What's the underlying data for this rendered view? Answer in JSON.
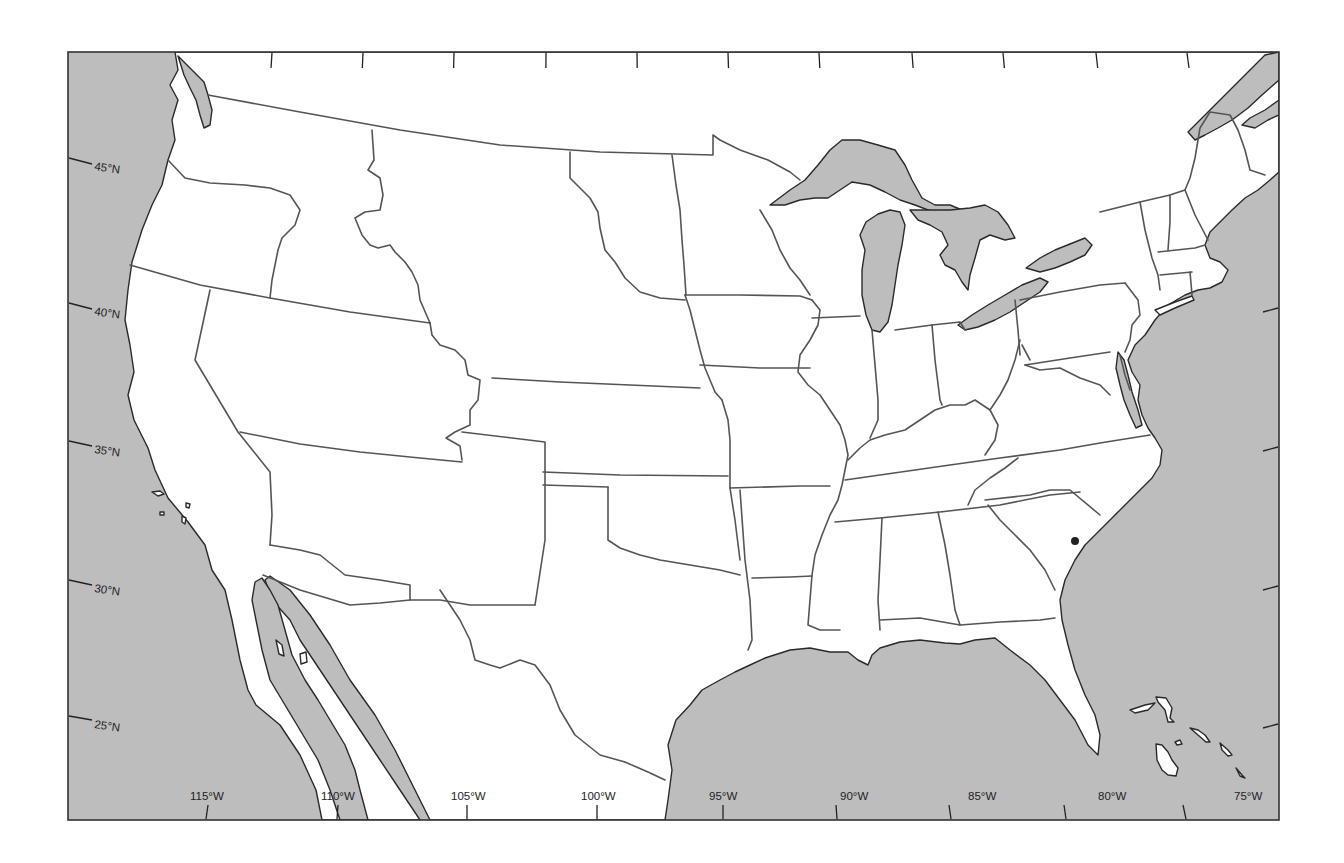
{
  "map": {
    "title": "United States About 1860",
    "colors": {
      "water": "#bdbdbd",
      "land": "#ffffff",
      "border": "#555555",
      "coastline": "#2a2a2a"
    },
    "frame": {
      "left": 68,
      "top": 52,
      "right": 1279,
      "bottom": 820
    },
    "latitude_labels": [
      {
        "label": "45°N",
        "y": 164
      },
      {
        "label": "40°N",
        "y": 310
      },
      {
        "label": "35°N",
        "y": 450
      },
      {
        "label": "30°N",
        "y": 590
      },
      {
        "label": "25°N",
        "y": 725
      }
    ],
    "longitude_labels": [
      {
        "label": "115°W",
        "x": 207
      },
      {
        "label": "110°W",
        "x": 338
      },
      {
        "label": "105°W",
        "x": 469
      },
      {
        "label": "100°W",
        "x": 598
      },
      {
        "label": "95°W",
        "x": 728
      },
      {
        "label": "90°W",
        "x": 857
      },
      {
        "label": "85°W",
        "x": 986
      },
      {
        "label": "80°W",
        "x": 1116
      },
      {
        "label": "75°W",
        "x": 1250
      }
    ],
    "top_tick_x": [
      240,
      292,
      344,
      396,
      446,
      496,
      546,
      598,
      648,
      700,
      752,
      804,
      856,
      908,
      960,
      1012,
      1064,
      1115
    ],
    "right_tick_y": [
      308,
      447,
      586,
      724
    ],
    "features": [
      {
        "name": "Pacific Ocean",
        "type": "water"
      },
      {
        "name": "Gulf of Mexico",
        "type": "water"
      },
      {
        "name": "Atlantic Ocean",
        "type": "water"
      },
      {
        "name": "Gulf of California",
        "type": "water"
      },
      {
        "name": "Lake Superior",
        "type": "water"
      },
      {
        "name": "Lake Michigan",
        "type": "water"
      },
      {
        "name": "Lake Huron",
        "type": "water"
      },
      {
        "name": "Lake Erie",
        "type": "water"
      },
      {
        "name": "Lake Ontario",
        "type": "water"
      },
      {
        "name": "Bahamas",
        "type": "islands"
      }
    ],
    "markers": [
      {
        "name": "city-dot",
        "x": 1075,
        "y": 541
      }
    ]
  }
}
